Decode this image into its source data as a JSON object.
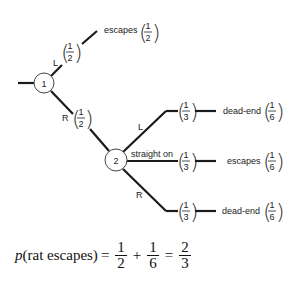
{
  "diagram": {
    "type": "probability-tree",
    "nodes": [
      {
        "id": "1",
        "label": "1"
      },
      {
        "id": "2",
        "label": "2"
      }
    ],
    "branches": {
      "node1_left": {
        "direction": "L",
        "prob": {
          "num": "1",
          "den": "2"
        },
        "outcome": "escapes",
        "outcome_prob": {
          "num": "1",
          "den": "2"
        }
      },
      "node1_right": {
        "direction": "R",
        "prob": {
          "num": "1",
          "den": "2"
        }
      },
      "node2_left": {
        "direction": "L",
        "prob": {
          "num": "1",
          "den": "3"
        },
        "outcome": "dead-end",
        "outcome_prob": {
          "num": "1",
          "den": "6"
        }
      },
      "node2_straight": {
        "direction": "straight on",
        "prob": {
          "num": "1",
          "den": "3"
        },
        "outcome": "escapes",
        "outcome_prob": {
          "num": "1",
          "den": "6"
        }
      },
      "node2_right": {
        "direction": "R",
        "prob": {
          "num": "1",
          "den": "3"
        },
        "outcome": "dead-end",
        "outcome_prob": {
          "num": "1",
          "den": "6"
        }
      }
    }
  },
  "equation": {
    "p": "p",
    "arg": "(rat escapes)",
    "eq1": "=",
    "t1": {
      "num": "1",
      "den": "2"
    },
    "plus": "+",
    "t2": {
      "num": "1",
      "den": "6"
    },
    "eq2": "=",
    "result": {
      "num": "2",
      "den": "3"
    }
  }
}
